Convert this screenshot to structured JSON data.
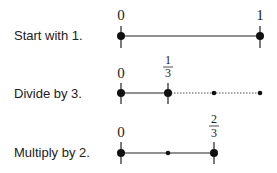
{
  "rows": [
    {
      "label": "Start with 1.",
      "start_label": "0",
      "end_label": "1"
    },
    {
      "label": "Divide by 3.",
      "start_label": "0",
      "mark_label": {
        "numerator": "1",
        "denominator": "3"
      }
    },
    {
      "label": "Multiply by 2.",
      "start_label": "0",
      "mark_label": {
        "numerator": "2",
        "denominator": "3"
      }
    }
  ],
  "colors": {
    "line": "#222222",
    "dotted": "#555555"
  }
}
